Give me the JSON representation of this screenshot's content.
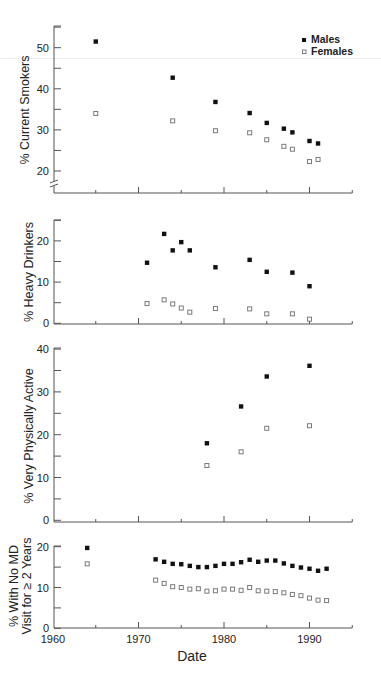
{
  "chart_data": [
    {
      "type": "scatter",
      "title": "",
      "xlabel": "",
      "ylabel": "% Current Smokers",
      "xlim": [
        1960,
        1995
      ],
      "ylim": [
        17,
        55
      ],
      "y_axis_break": true,
      "yticks_major": [
        20,
        30,
        40,
        50
      ],
      "yticks_minor": [
        25,
        35,
        45,
        55
      ],
      "xticks_major": [
        1970,
        1980,
        1990
      ],
      "xticks_minor": [
        1965,
        1975,
        1985,
        1995
      ],
      "grid": false,
      "legend_position": "upper right",
      "legend": [
        "Males",
        "Females"
      ],
      "series": [
        {
          "name": "Males",
          "marker": "filled-square",
          "x": [
            1965,
            1974,
            1979,
            1983,
            1985,
            1987,
            1988,
            1990,
            1991
          ],
          "y": [
            51.5,
            42.7,
            36.8,
            34.1,
            31.7,
            30.3,
            29.4,
            27.3,
            26.7
          ]
        },
        {
          "name": "Females",
          "marker": "open-square",
          "x": [
            1965,
            1974,
            1979,
            1983,
            1985,
            1987,
            1988,
            1990,
            1991
          ],
          "y": [
            34.0,
            32.2,
            29.8,
            29.3,
            27.6,
            26.0,
            25.3,
            22.3,
            22.8
          ]
        }
      ]
    },
    {
      "type": "scatter",
      "title": "",
      "xlabel": "",
      "ylabel": "% Heavy Drinkers",
      "xlim": [
        1960,
        1995
      ],
      "ylim": [
        0,
        25
      ],
      "yticks_major": [
        0,
        10,
        20
      ],
      "yticks_minor": [
        5,
        15,
        25
      ],
      "xticks_major": [
        1970,
        1980,
        1990
      ],
      "xticks_minor": [
        1965,
        1975,
        1985,
        1995
      ],
      "grid": false,
      "series": [
        {
          "name": "Males",
          "marker": "filled-square",
          "x": [
            1971,
            1973,
            1974,
            1975,
            1976,
            1979,
            1983,
            1985,
            1988,
            1990
          ],
          "y": [
            14.7,
            21.7,
            17.7,
            19.7,
            17.7,
            13.6,
            15.4,
            12.5,
            12.3,
            9.0
          ]
        },
        {
          "name": "Females",
          "marker": "open-square",
          "x": [
            1971,
            1973,
            1974,
            1975,
            1976,
            1979,
            1983,
            1985,
            1988,
            1990
          ],
          "y": [
            4.8,
            5.7,
            4.7,
            3.7,
            2.7,
            3.6,
            3.5,
            2.3,
            2.3,
            1.0
          ]
        }
      ]
    },
    {
      "type": "scatter",
      "title": "",
      "xlabel": "",
      "ylabel": "% Very Physically Active",
      "xlim": [
        1960,
        1995
      ],
      "ylim": [
        0,
        40
      ],
      "yticks_major": [
        0,
        10,
        20,
        30,
        40
      ],
      "yticks_minor": [
        5,
        15,
        25,
        35
      ],
      "xticks_major": [
        1970,
        1980,
        1990
      ],
      "xticks_minor": [
        1965,
        1975,
        1985,
        1995
      ],
      "grid": false,
      "series": [
        {
          "name": "Males",
          "marker": "filled-square",
          "x": [
            1978,
            1982,
            1985,
            1990
          ],
          "y": [
            18.0,
            26.6,
            33.6,
            36.1
          ]
        },
        {
          "name": "Females",
          "marker": "open-square",
          "x": [
            1978,
            1982,
            1985,
            1990
          ],
          "y": [
            12.8,
            16.0,
            21.5,
            22.1
          ]
        }
      ]
    },
    {
      "type": "scatter",
      "title": "",
      "xlabel": "Date",
      "ylabel": "% With No MD Visit for ≥ 2 Years",
      "ylabel_lines": [
        "% With No MD",
        "Visit for ≥ 2 Years"
      ],
      "xlim": [
        1960,
        1995
      ],
      "ylim": [
        0,
        20
      ],
      "yticks_major": [
        0,
        10,
        20
      ],
      "yticks_minor": [
        5,
        15
      ],
      "xticks_major": [
        1960,
        1970,
        1980,
        1990
      ],
      "xticks_minor": [
        1965,
        1975,
        1985,
        1995
      ],
      "xtick_labels": [
        "1960",
        "1970",
        "1980",
        "1990"
      ],
      "grid": false,
      "series": [
        {
          "name": "Males",
          "marker": "filled-square",
          "x": [
            1964,
            1972,
            1973,
            1974,
            1975,
            1976,
            1977,
            1978,
            1979,
            1980,
            1981,
            1982,
            1983,
            1984,
            1985,
            1986,
            1987,
            1988,
            1989,
            1990,
            1991,
            1992
          ],
          "y": [
            19.7,
            16.9,
            16.3,
            15.8,
            15.7,
            15.3,
            15.0,
            15.0,
            15.3,
            15.8,
            15.8,
            16.2,
            16.8,
            16.3,
            16.6,
            16.6,
            15.9,
            15.3,
            14.9,
            14.6,
            14.1,
            14.6
          ]
        },
        {
          "name": "Females",
          "marker": "open-square",
          "x": [
            1964,
            1972,
            1973,
            1974,
            1975,
            1976,
            1977,
            1978,
            1979,
            1980,
            1981,
            1982,
            1983,
            1984,
            1985,
            1986,
            1987,
            1988,
            1989,
            1990,
            1991,
            1992
          ],
          "y": [
            15.8,
            11.8,
            11.0,
            10.2,
            10.0,
            9.6,
            9.7,
            9.1,
            9.2,
            9.6,
            9.6,
            9.3,
            10.0,
            9.2,
            9.1,
            9.0,
            8.7,
            8.3,
            8.0,
            7.4,
            6.9,
            6.8
          ]
        }
      ]
    }
  ],
  "legend": {
    "males_label": "Males",
    "females_label": "Females"
  },
  "axes_text": {
    "panel1_ylabel": "% Current Smokers",
    "panel2_ylabel": "% Heavy Drinkers",
    "panel3_ylabel": "% Very Physically Active",
    "panel4_ylabel_line1": "% With No MD",
    "panel4_ylabel_line2": "Visit for ≥ 2 Years",
    "xlabel": "Date"
  },
  "colors": {
    "male_marker": "#111111",
    "female_marker_edge": "#7a7a7a",
    "female_marker_fill": "#ffffff",
    "axis": "#555555",
    "text": "#222222"
  }
}
